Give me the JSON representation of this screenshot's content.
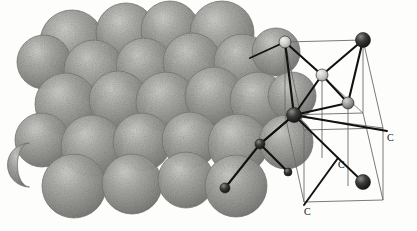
{
  "figure": {
    "element_symbol": "C",
    "background_color": "#fdfdfc",
    "sphere_fill": "#9b9b97",
    "sphere_highlight": "#c3c3bf",
    "sphere_shadow": "#7c7c78",
    "sphere_edge": "#6f6f6b",
    "bond_color": "#111111",
    "cell_edge_color": "#6b6b6b",
    "atom_light": "#d8d8d4",
    "atom_dark": "#1c1c1c",
    "atom_mid": "#8d8d89"
  },
  "labels": [
    {
      "text": "C",
      "x": 387,
      "y": 133
    },
    {
      "text": "C",
      "x": 338,
      "y": 160
    },
    {
      "text": "C",
      "x": 304,
      "y": 207
    }
  ],
  "space_filling_model": {
    "name": "space-filling-sphere-cluster",
    "sphere_count": 26,
    "spheres": [
      {
        "cx": 72,
        "cy": 42,
        "r": 32
      },
      {
        "cx": 126,
        "cy": 33,
        "r": 30
      },
      {
        "cx": 170,
        "cy": 30,
        "r": 29
      },
      {
        "cx": 222,
        "cy": 33,
        "r": 32
      },
      {
        "cx": 44,
        "cy": 62,
        "r": 27
      },
      {
        "cx": 94,
        "cy": 70,
        "r": 30
      },
      {
        "cx": 144,
        "cy": 66,
        "r": 28
      },
      {
        "cx": 192,
        "cy": 62,
        "r": 29
      },
      {
        "cx": 242,
        "cy": 62,
        "r": 28
      },
      {
        "cx": 276,
        "cy": 52,
        "r": 24
      },
      {
        "cx": 66,
        "cy": 104,
        "r": 31
      },
      {
        "cx": 118,
        "cy": 100,
        "r": 29
      },
      {
        "cx": 166,
        "cy": 102,
        "r": 30
      },
      {
        "cx": 214,
        "cy": 96,
        "r": 29
      },
      {
        "cx": 258,
        "cy": 100,
        "r": 28
      },
      {
        "cx": 292,
        "cy": 96,
        "r": 24
      },
      {
        "cx": 42,
        "cy": 140,
        "r": 27
      },
      {
        "cx": 92,
        "cy": 146,
        "r": 31
      },
      {
        "cx": 142,
        "cy": 142,
        "r": 29
      },
      {
        "cx": 190,
        "cy": 140,
        "r": 28
      },
      {
        "cx": 238,
        "cy": 144,
        "r": 30
      },
      {
        "cx": 286,
        "cy": 142,
        "r": 27
      },
      {
        "cx": 74,
        "cy": 186,
        "r": 32
      },
      {
        "cx": 132,
        "cy": 184,
        "r": 30
      },
      {
        "cx": 186,
        "cy": 180,
        "r": 28
      },
      {
        "cx": 236,
        "cy": 186,
        "r": 31
      }
    ],
    "crescent": {
      "cx": 24,
      "cy": 165,
      "r": 22
    }
  },
  "unit_cell": {
    "name": "diamond-cubic-unit-cell",
    "atoms": [
      {
        "id": "a1",
        "cx": 285,
        "cy": 42,
        "r": 6,
        "shade": "light"
      },
      {
        "id": "a2",
        "cx": 363,
        "cy": 40,
        "r": 7.5,
        "shade": "dark"
      },
      {
        "id": "a3",
        "cx": 322,
        "cy": 75,
        "r": 6,
        "shade": "light"
      },
      {
        "id": "a4",
        "cx": 348,
        "cy": 103,
        "r": 6,
        "shade": "mid"
      },
      {
        "id": "a5",
        "cx": 294,
        "cy": 115,
        "r": 7.5,
        "shade": "dark"
      },
      {
        "id": "a6",
        "cx": 363,
        "cy": 182,
        "r": 7.5,
        "shade": "dark"
      },
      {
        "id": "a7",
        "cx": 260,
        "cy": 144,
        "r": 5,
        "shade": "dark"
      },
      {
        "id": "a8",
        "cx": 288,
        "cy": 172,
        "r": 4,
        "shade": "dark"
      },
      {
        "id": "a9",
        "cx": 225,
        "cy": 188,
        "r": 5,
        "shade": "dark"
      }
    ],
    "bonds": [
      {
        "from": "a1",
        "to": "a3"
      },
      {
        "from": "a2",
        "to": "a3"
      },
      {
        "from": "a3",
        "to": "a4"
      },
      {
        "from": "a3",
        "to": "a5"
      },
      {
        "from": "a2",
        "to": "a4"
      },
      {
        "from": "a4",
        "to": "a5"
      },
      {
        "from": "a5",
        "to": "a7"
      },
      {
        "from": "a7",
        "to": "a8"
      },
      {
        "from": "a7",
        "to": "a9"
      },
      {
        "from": "a1",
        "to": "a5"
      }
    ]
  }
}
